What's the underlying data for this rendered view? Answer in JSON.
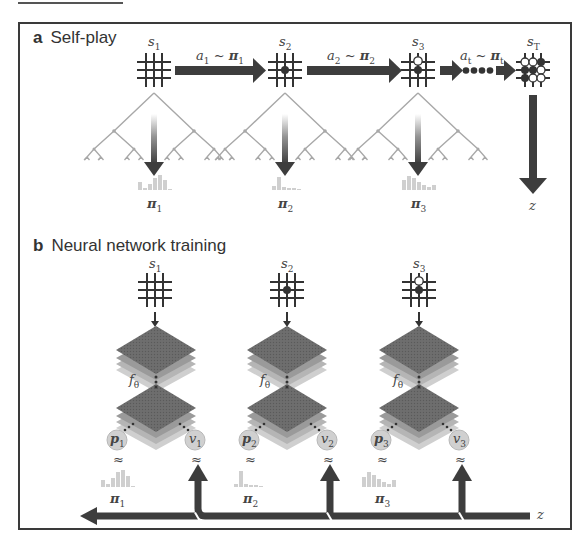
{
  "panel_a": {
    "letter": "a",
    "title": "Self-play",
    "states": [
      {
        "label": "s",
        "sub": "1",
        "board": "empty"
      },
      {
        "label": "s",
        "sub": "2",
        "board": "one-black"
      },
      {
        "label": "s",
        "sub": "3",
        "board": "black-white"
      },
      {
        "label": "s",
        "sub": "T",
        "board": "terminal"
      }
    ],
    "transitions": [
      {
        "action": "a",
        "action_sub": "1",
        "sep": "~",
        "policy": "π",
        "policy_sub": "1"
      },
      {
        "action": "a",
        "action_sub": "2",
        "sep": "~",
        "policy": "π",
        "policy_sub": "2"
      },
      {
        "action": "a",
        "action_sub": "t",
        "sep": "~",
        "policy": "π",
        "policy_sub": "t"
      }
    ],
    "search_policies": [
      {
        "label": "π",
        "sub": "1"
      },
      {
        "label": "π",
        "sub": "2"
      },
      {
        "label": "π",
        "sub": "3"
      }
    ],
    "outcome": {
      "label": "z"
    }
  },
  "panel_b": {
    "letter": "b",
    "title": "Neural network training",
    "columns": [
      {
        "state": "s",
        "state_sub": "1",
        "net": "f",
        "net_sub": "θ",
        "p": "p",
        "p_sub": "1",
        "v": "v",
        "v_sub": "1",
        "pi": "π",
        "pi_sub": "1",
        "approx": "≈"
      },
      {
        "state": "s",
        "state_sub": "2",
        "net": "f",
        "net_sub": "θ",
        "p": "p",
        "p_sub": "2",
        "v": "v",
        "v_sub": "2",
        "pi": "π",
        "pi_sub": "2",
        "approx": "≈"
      },
      {
        "state": "s",
        "state_sub": "3",
        "net": "f",
        "net_sub": "θ",
        "p": "p",
        "p_sub": "3",
        "v": "v",
        "v_sub": "3",
        "pi": "π",
        "pi_sub": "3",
        "approx": "≈"
      }
    ],
    "outcome": {
      "label": "z"
    }
  },
  "colors": {
    "frame": "#3a3a3a",
    "arrow": "#3d3d3d",
    "tree": "#a8a8a8",
    "histogram": "#cfcfcf",
    "layer_top": "#6b6b6b",
    "layer_mid": "#9a9a9a",
    "layer_low": "#c4c4c4",
    "node_fill": "#d0d0d0"
  }
}
